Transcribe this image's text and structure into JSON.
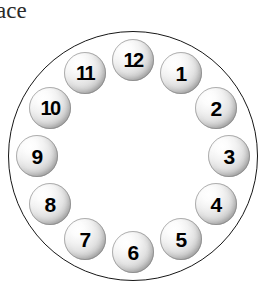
{
  "figure": {
    "name": "clock-face-diagram",
    "caption_fragment": "ace",
    "outer_circle": {
      "center_x": 133,
      "center_y": 156,
      "diameter": 250,
      "stroke_color": "#171717",
      "fill_color": "#ffffff"
    },
    "ball_style": {
      "diameter": 42,
      "highlight_color": "#ffffff",
      "shadow_color": "#9b9b9b",
      "text_color": "#000000"
    },
    "ring_radius": 96,
    "balls": [
      {
        "label": "12",
        "angle_deg": 0,
        "x": 112,
        "y": 39,
        "wide": true
      },
      {
        "label": "1",
        "angle_deg": 30,
        "x": 160,
        "y": 52,
        "wide": false
      },
      {
        "label": "2",
        "angle_deg": 60,
        "x": 195,
        "y": 87,
        "wide": false
      },
      {
        "label": "3",
        "angle_deg": 90,
        "x": 208,
        "y": 135,
        "wide": false
      },
      {
        "label": "4",
        "angle_deg": 120,
        "x": 195,
        "y": 183,
        "wide": false
      },
      {
        "label": "5",
        "angle_deg": 150,
        "x": 160,
        "y": 218,
        "wide": false
      },
      {
        "label": "6",
        "angle_deg": 180,
        "x": 112,
        "y": 231,
        "wide": false
      },
      {
        "label": "7",
        "angle_deg": 210,
        "x": 64,
        "y": 218,
        "wide": false
      },
      {
        "label": "8",
        "angle_deg": 240,
        "x": 29,
        "y": 183,
        "wide": false
      },
      {
        "label": "9",
        "angle_deg": 270,
        "x": 16,
        "y": 135,
        "wide": false
      },
      {
        "label": "10",
        "angle_deg": 300,
        "x": 29,
        "y": 87,
        "wide": true
      },
      {
        "label": "11",
        "angle_deg": 330,
        "x": 64,
        "y": 52,
        "wide": true
      }
    ]
  }
}
